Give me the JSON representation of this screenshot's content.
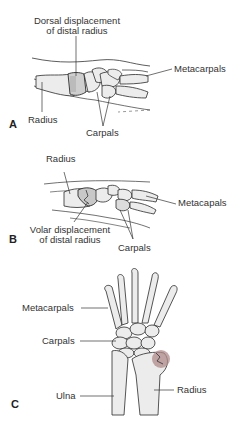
{
  "figure": {
    "panels": [
      {
        "letter": "A",
        "view": "lateral",
        "labels": {
          "displacement_line1": "Dorsal displacement",
          "displacement_line2": "of distal radius",
          "metacarpals": "Metacarpals",
          "radius": "Radius",
          "carpals": "Carpals"
        }
      },
      {
        "letter": "B",
        "view": "lateral",
        "labels": {
          "radius": "Radius",
          "metacarpals": "Metacapals",
          "displacement_line1": "Volar displacement",
          "displacement_line2": "of distal radius",
          "carpals": "Carpals"
        }
      },
      {
        "letter": "C",
        "view": "anterior",
        "labels": {
          "metacarpals": "Metacarpals",
          "carpals": "Carpals",
          "ulna": "Ulna",
          "radius": "Radius"
        }
      }
    ],
    "colors": {
      "bone_fill": "#ececec",
      "bone_stroke": "#2b2b2b",
      "fracture_highlight": "#b08a8a",
      "label_text": "#333333"
    }
  }
}
